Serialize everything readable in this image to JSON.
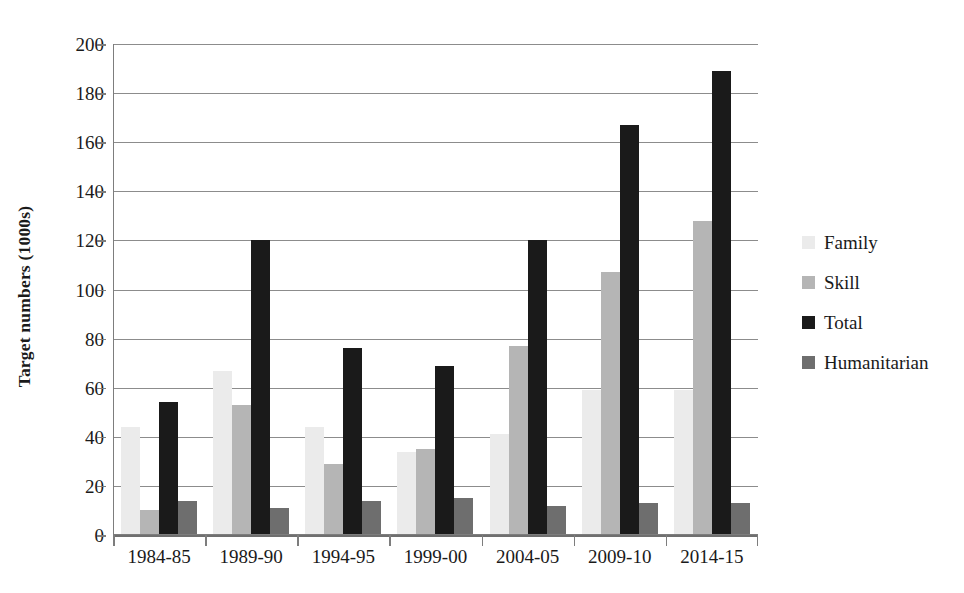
{
  "chart_data": {
    "type": "bar",
    "title": "",
    "xlabel": "",
    "ylabel": "Target numbers (1000s)",
    "ylim": [
      0,
      200
    ],
    "yticks": [
      0,
      20,
      40,
      60,
      80,
      100,
      120,
      140,
      160,
      180,
      200
    ],
    "grid": true,
    "legend_position": "right",
    "categories": [
      "1984-85",
      "1989-90",
      "1994-95",
      "1999-00",
      "2004-05",
      "2009-10",
      "2014-15"
    ],
    "series": [
      {
        "name": "Family",
        "color": "#ebebeb",
        "values": [
          44,
          67,
          44,
          34,
          41,
          59,
          59
        ]
      },
      {
        "name": "Skill",
        "color": "#b5b5b5",
        "values": [
          10,
          53,
          29,
          35,
          77,
          107,
          128
        ]
      },
      {
        "name": "Total",
        "color": "#1a1a1a",
        "values": [
          54,
          120,
          76,
          69,
          120,
          167,
          189
        ]
      },
      {
        "name": "Humanitarian",
        "color": "#6e6e6e",
        "values": [
          14,
          11,
          14,
          15,
          12,
          13,
          13
        ]
      }
    ]
  }
}
